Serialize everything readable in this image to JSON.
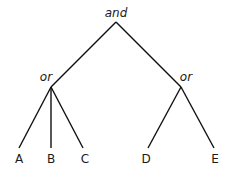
{
  "diagram": {
    "type": "tree",
    "root": {
      "id": "root",
      "label": "and",
      "x": 116,
      "y": 22,
      "label_x": 116,
      "label_y": 17
    },
    "operators": [
      {
        "id": "or-left",
        "label": "or",
        "x": 51,
        "y": 87,
        "label_x": 46,
        "label_y": 81
      },
      {
        "id": "or-right",
        "label": "or",
        "x": 181,
        "y": 87,
        "label_x": 186,
        "label_y": 81
      }
    ],
    "leaves": [
      {
        "id": "A",
        "label": "A",
        "x": 19,
        "y": 148,
        "parent": "or-left"
      },
      {
        "id": "B",
        "label": "B",
        "x": 51,
        "y": 148,
        "parent": "or-left"
      },
      {
        "id": "C",
        "label": "C",
        "x": 83,
        "y": 148,
        "parent": "or-left"
      },
      {
        "id": "D",
        "label": "D",
        "x": 148,
        "y": 148,
        "parent": "or-right"
      },
      {
        "id": "E",
        "label": "E",
        "x": 214,
        "y": 148,
        "parent": "or-right"
      }
    ],
    "leaf_label_y": 163,
    "colors": {
      "line": "#111111",
      "text": "#1a1a1a",
      "background": "#ffffff"
    }
  }
}
